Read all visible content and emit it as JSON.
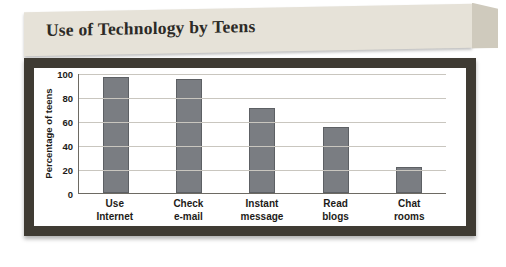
{
  "banner": {
    "title": "Use of Technology by Teens"
  },
  "chart_data": {
    "type": "bar",
    "title": "Use of Technology by Teens",
    "xlabel": "",
    "ylabel": "Percentage of teens",
    "categories": [
      "Use Internet",
      "Check e-mail",
      "Instant message",
      "Read blogs",
      "Chat rooms"
    ],
    "category_lines": [
      [
        "Use",
        "Internet"
      ],
      [
        "Check",
        "e-mail"
      ],
      [
        "Instant",
        "message"
      ],
      [
        "Read",
        "blogs"
      ],
      [
        "Chat",
        "rooms"
      ]
    ],
    "values": [
      97,
      95,
      71,
      55,
      22
    ],
    "ylim": [
      0,
      100
    ],
    "yticks": [
      0,
      20,
      40,
      60,
      80,
      100
    ],
    "grid": true,
    "legend": "none",
    "bar_color": "#7a7d82",
    "frame_color": "#3f3b33",
    "banner_color": "#e6e2d8"
  }
}
